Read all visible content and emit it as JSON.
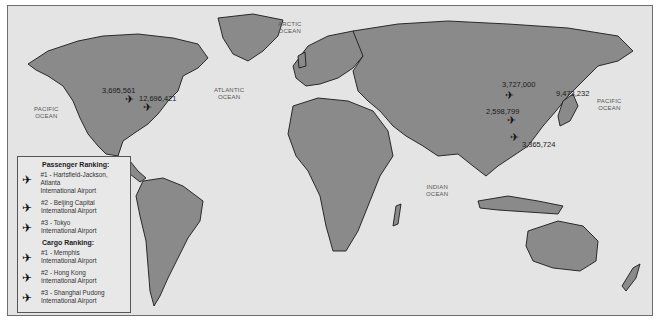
{
  "map": {
    "ocean_labels": [
      {
        "id": "arctic",
        "text": "ARCTIC\nOCEAN"
      },
      {
        "id": "atlantic",
        "text": "ATLANTIC\nOCEAN"
      },
      {
        "id": "pacific-west",
        "text": "PACIFIC\nOCEAN"
      },
      {
        "id": "pacific-east",
        "text": "PACIFIC\nOCEAN"
      },
      {
        "id": "indian",
        "text": "INDIAN\nOCEAN"
      }
    ],
    "stats": {
      "atlanta": "3,695,561",
      "memphis": "12,696,421",
      "beijing": "3,727,000",
      "tokyo": "9,473,232",
      "shanghai": "2,598,799",
      "hong_kong": "3,365,724"
    }
  },
  "legend": {
    "passenger_heading": "Passenger Ranking:",
    "passenger": [
      {
        "rank": "#1 - Hartsfield-Jackson, Atlanta",
        "line2": "International Airport"
      },
      {
        "rank": "#2 - Beijing Capital",
        "line2": "International Airport"
      },
      {
        "rank": "#3 - Tokyo",
        "line2": "International Airport"
      }
    ],
    "cargo_heading": "Cargo Ranking:",
    "cargo": [
      {
        "rank": "#1 - Memphis",
        "line2": "International Airport"
      },
      {
        "rank": "#2 - Hong Kong",
        "line2": "International Airport"
      },
      {
        "rank": "#3 - Shanghai Pudong",
        "line2": "International Airport"
      }
    ]
  },
  "icons": {
    "plane": "✈"
  }
}
